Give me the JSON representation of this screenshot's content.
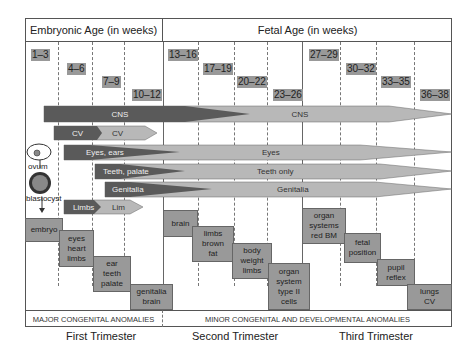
{
  "header": {
    "embryonic": "Embryonic Age (in weeks)",
    "fetal": "Fetal Age (in weeks)"
  },
  "weeks": [
    "1–3",
    "4–6",
    "7–9",
    "10–12",
    "13–16",
    "17–19",
    "20–22",
    "23–26",
    "27–29",
    "30–32",
    "33–35",
    "36–38"
  ],
  "bands": {
    "cns_dark": "CNS",
    "cns_light": "CNS",
    "cv_dark": "CV",
    "cv_light": "CV",
    "eyes_dark": "Eyes, ears",
    "eyes_light": "Eyes",
    "teeth_dark": "Teeth, palate",
    "teeth_light": "Teeth only",
    "genitalia_dark": "Genitalia",
    "genitalia_light": "Genitalia",
    "limbs_dark": "Limbs",
    "limbs_light": "Lim"
  },
  "side_labels": {
    "ovum": "ovum",
    "blastocyst": "blastocyst"
  },
  "boxes": {
    "embryo": "embryo",
    "eyes_heart_limbs": "eyes\nheart\nlimbs",
    "ear_teeth_palate": "ear\nteeth\npalate",
    "genitalia_brain": "genitalia\nbrain",
    "brain": "brain",
    "limbs_brown_fat": "limbs\nbrown\nfat",
    "body_weight_limbs": "body\nweight\nlimbs",
    "organ_system_type_ii": "organ\nsystem\ntype II\ncells",
    "organ_systems_red_bm": "organ\nsystems\nred BM",
    "fetal_position": "fetal\nposition",
    "pupil_reflex": "pupil\nreflex",
    "lungs_cv": "lungs\nCV"
  },
  "footer": {
    "major": "MAJOR CONGENITAL ANOMALIES",
    "minor": "MINOR CONGENITAL AND DEVELOPMENTAL ANOMALIES"
  },
  "trimesters": [
    "First Trimester",
    "Second Trimester",
    "Third Trimester"
  ],
  "colors": {
    "dark": "#5a5a5a",
    "light": "#b8b8b8",
    "box": "#999999"
  }
}
